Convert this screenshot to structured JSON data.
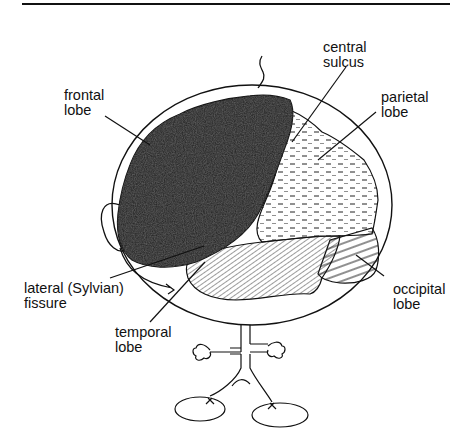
{
  "diagram": {
    "labels": {
      "central_sulcus": {
        "line1": "central",
        "line2": "sulcus"
      },
      "frontal_lobe": {
        "line1": "frontal",
        "line2": "lobe"
      },
      "parietal_lobe": {
        "line1": "parietal",
        "line2": "lobe"
      },
      "lateral_fissure": {
        "line1": "lateral (Sylvian)",
        "line2": "fissure"
      },
      "temporal_lobe": {
        "line1": "temporal",
        "line2": "lobe"
      },
      "occipital_lobe": {
        "line1": "occipital",
        "line2": "lobe"
      }
    },
    "regions": [
      {
        "name": "frontal lobe",
        "fill": "dark stipple"
      },
      {
        "name": "parietal lobe",
        "fill": "dashes"
      },
      {
        "name": "temporal lobe",
        "fill": "diagonal hatching"
      },
      {
        "name": "occipital lobe",
        "fill": "horizontal lines"
      }
    ],
    "colors": {
      "ink": "#111111",
      "frontal": "#2e2e2e",
      "background": "#ffffff"
    }
  }
}
